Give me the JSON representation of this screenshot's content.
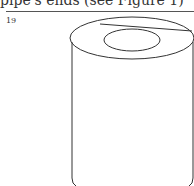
{
  "header": {
    "clipped_text": "pipe's ends (see Figure 1)",
    "page_number": "19"
  },
  "figure": {
    "stroke_color": "#333333"
  }
}
